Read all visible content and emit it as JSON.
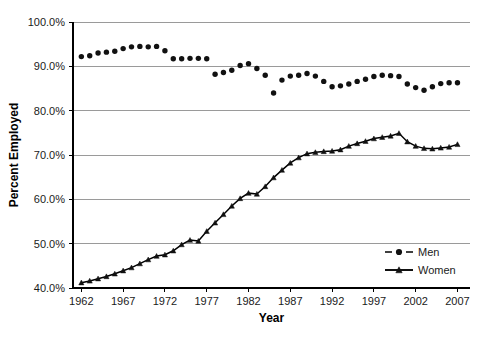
{
  "chart_data": {
    "type": "line",
    "title": "",
    "xlabel": "Year",
    "ylabel": "Percent Employed",
    "xlim": [
      1961,
      2008.5
    ],
    "ylim": [
      40,
      100
    ],
    "grid": true,
    "legend_position": "inside-right",
    "y_ticks": [
      40,
      50,
      60,
      70,
      80,
      90,
      100
    ],
    "y_tick_labels": [
      "40.0%",
      "50.0%",
      "60.0%",
      "70.0%",
      "80.0%",
      "90.0%",
      "100.0%"
    ],
    "x_ticks": [
      1962,
      1967,
      1972,
      1977,
      1982,
      1987,
      1992,
      1997,
      2002,
      2007
    ],
    "x_tick_labels": [
      "1962",
      "1967",
      "1972",
      "1977",
      "1982",
      "1987",
      "1992",
      "1997",
      "2002",
      "2007"
    ],
    "x": [
      1962,
      1963,
      1964,
      1965,
      1966,
      1967,
      1968,
      1969,
      1970,
      1971,
      1972,
      1973,
      1974,
      1975,
      1976,
      1977,
      1978,
      1979,
      1980,
      1981,
      1982,
      1983,
      1984,
      1985,
      1986,
      1987,
      1988,
      1989,
      1990,
      1991,
      1992,
      1993,
      1994,
      1995,
      1996,
      1997,
      1998,
      1999,
      2000,
      2001,
      2002,
      2003,
      2004,
      2005,
      2006,
      2007
    ],
    "series": [
      {
        "name": "Men",
        "marker": "circle",
        "linestyle": "dashed",
        "color": "#111111",
        "values": [
          92.2,
          92.4,
          93.0,
          93.2,
          93.4,
          94.0,
          94.4,
          94.5,
          94.4,
          94.5,
          93.5,
          91.7,
          91.7,
          91.8,
          91.8,
          91.7,
          88.2,
          88.6,
          89.1,
          90.2,
          90.6,
          89.5,
          88.0,
          84.0,
          86.9,
          87.8,
          88.0,
          88.4,
          87.8,
          86.6,
          85.4,
          85.6,
          86.0,
          86.6,
          87.1,
          87.7,
          88.0,
          87.9,
          87.7,
          86.0,
          85.2,
          84.6,
          85.4,
          86.1,
          86.3,
          86.3
        ]
      },
      {
        "name": "Women",
        "marker": "triangle",
        "linestyle": "solid",
        "color": "#111111",
        "values": [
          41.2,
          41.6,
          42.1,
          42.6,
          43.2,
          43.9,
          44.6,
          45.5,
          46.4,
          47.2,
          47.5,
          48.4,
          49.8,
          50.8,
          50.6,
          52.8,
          54.7,
          56.6,
          58.5,
          60.2,
          61.4,
          61.2,
          62.9,
          64.9,
          66.6,
          68.2,
          69.4,
          70.3,
          70.6,
          70.8,
          70.9,
          71.2,
          72.0,
          72.6,
          73.1,
          73.7,
          74.0,
          74.3,
          74.9,
          73.0,
          72.0,
          71.5,
          71.4,
          71.6,
          71.8,
          72.4
        ]
      }
    ]
  },
  "legend": {
    "entries": [
      {
        "label": "Men"
      },
      {
        "label": "Women"
      }
    ]
  },
  "axes": {
    "x_title": "Year",
    "y_title": "Percent Employed"
  }
}
